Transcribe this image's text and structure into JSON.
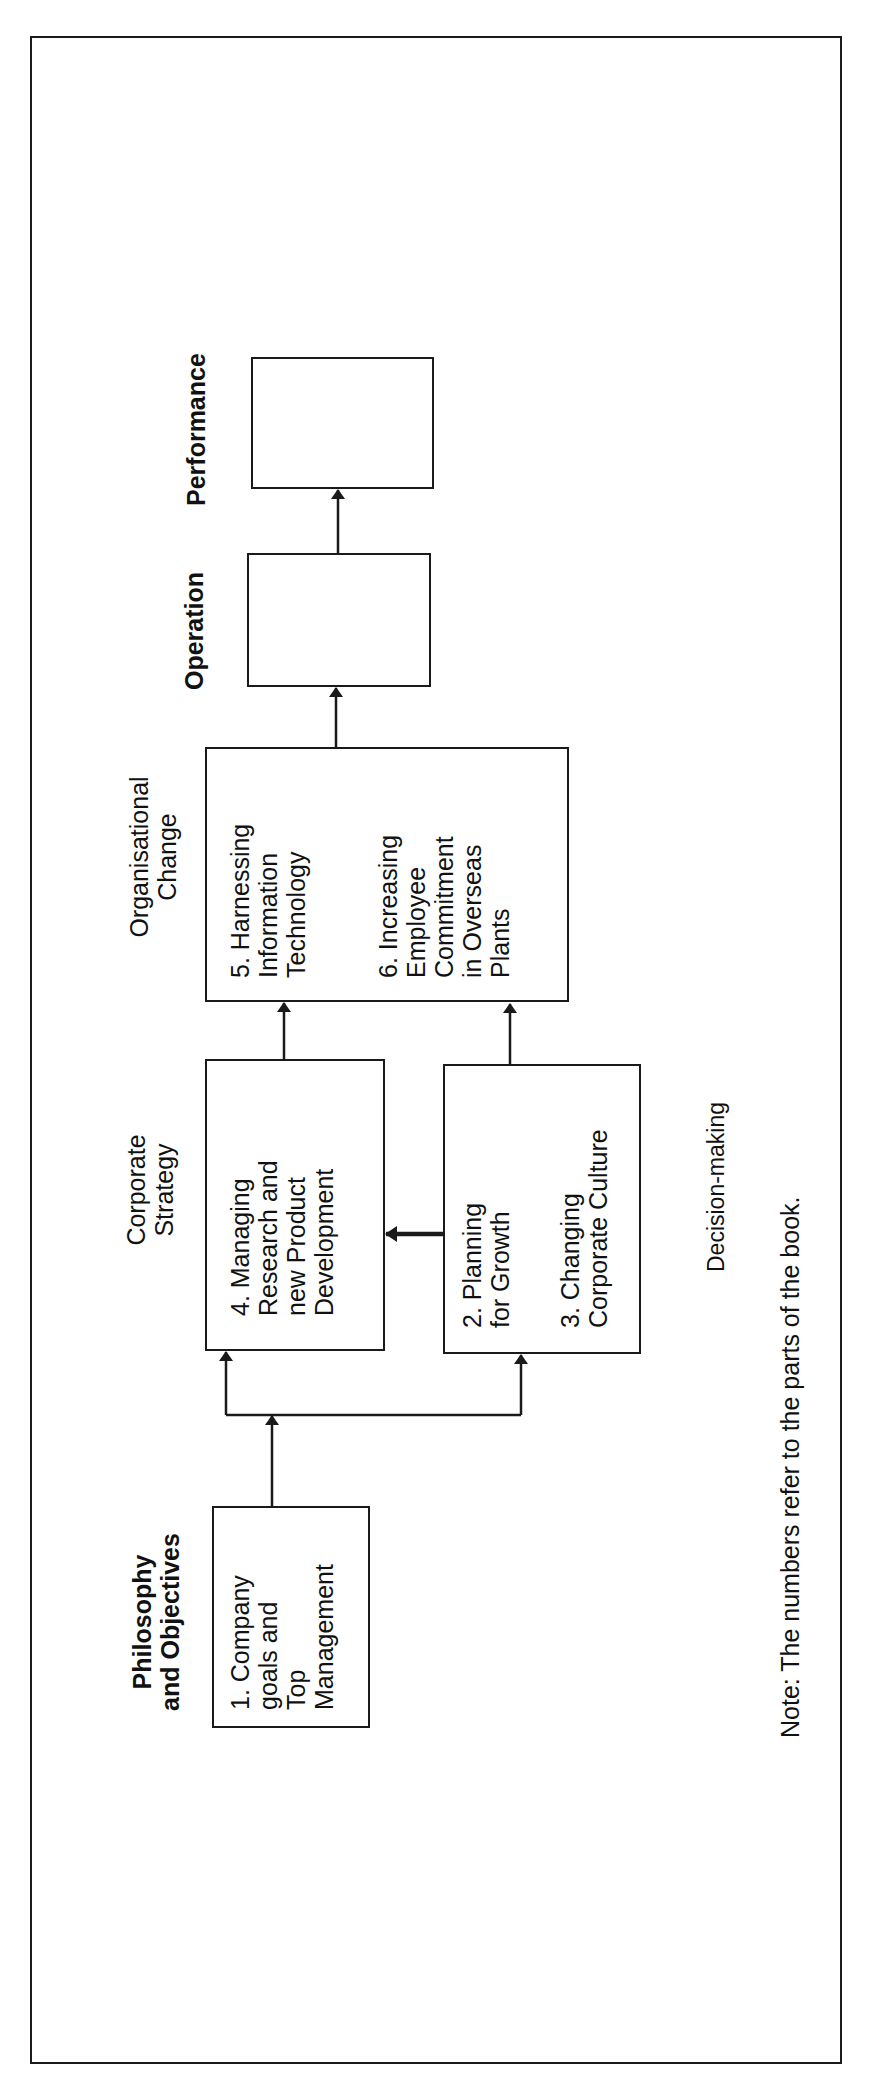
{
  "diagram": {
    "orientation": "rotated-90-ccw",
    "stages": [
      {
        "id": "philosophy",
        "heading": "Philosophy\nand Objectives",
        "heading_bold": true
      },
      {
        "id": "strategy",
        "heading": "Corporate\nStrategy",
        "heading_bold": false
      },
      {
        "id": "org_change",
        "heading": "Organisational\nChange",
        "heading_bold": false
      },
      {
        "id": "operation",
        "heading": "Operation",
        "heading_bold": true
      },
      {
        "id": "performance",
        "heading": "Performance",
        "heading_bold": true
      }
    ],
    "boxes": {
      "box1": "1. Company\ngoals and\nTop\nManagement",
      "box4": "4. Managing\nResearch and\nnew Product\nDevelopment",
      "box23_a": "2. Planning\nfor Growth",
      "box23_b": "3. Changing\nCorporate Culture",
      "box56_a": "5. Harnessing\nInformation\nTechnology",
      "box56_b": "6. Increasing\nEmployee\nCommitment\nin Overseas\nPlants",
      "operation": "",
      "performance": ""
    },
    "side_label": "Decision-making",
    "note": "Note: The numbers refer to the parts of the book.",
    "edges": [
      {
        "from": "box1",
        "to": "box4"
      },
      {
        "from": "box1",
        "to": "box23"
      },
      {
        "from": "box23",
        "to": "box4"
      },
      {
        "from": "box4",
        "to": "box56"
      },
      {
        "from": "box23",
        "to": "box56"
      },
      {
        "from": "box56",
        "to": "operation"
      },
      {
        "from": "operation",
        "to": "performance"
      }
    ],
    "colors": {
      "line": "#1a1a1a",
      "background": "#ffffff"
    }
  }
}
